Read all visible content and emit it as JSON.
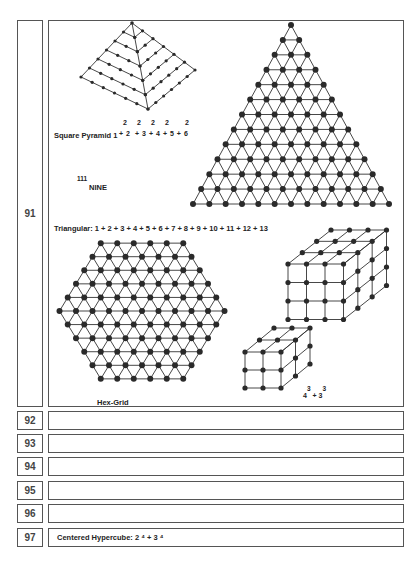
{
  "rows": [
    {
      "number": "91",
      "caption": ""
    },
    {
      "number": "92",
      "caption": ""
    },
    {
      "number": "93",
      "caption": ""
    },
    {
      "number": "94",
      "caption": ""
    },
    {
      "number": "95",
      "caption": ""
    },
    {
      "number": "96",
      "caption": ""
    },
    {
      "number": "97",
      "caption": "Centered Hypercube: 2 ⁴ + 3 ⁴"
    }
  ],
  "figures": {
    "square_pyramid": {
      "label": "Square Pyramid 1",
      "terms": [
        "2",
        "+ 2",
        "2",
        "+ 3",
        "2",
        "+ 4",
        "2",
        "+ 5 + 6",
        "2"
      ],
      "text": "Square Pyramid 1² + 2² + 3² + 4² + 5² + 6²"
    },
    "nine": {
      "superscript": "111",
      "text": "NINE"
    },
    "triangular": {
      "label": "Triangular: 1  + 2  + 3  + 4  + 5   + 6  + 7  + 8  + 9  + 10  + 11  + 12  + 13",
      "rows": 13
    },
    "hex_grid": {
      "label": "Hex-Grid"
    },
    "cubes": {
      "base1": "4",
      "exp1": "3",
      "plus": "+",
      "base2": "3",
      "exp2": "3"
    }
  },
  "colors": {
    "line": "#333333",
    "dot": "#2a2a2a",
    "border": "#555555"
  }
}
